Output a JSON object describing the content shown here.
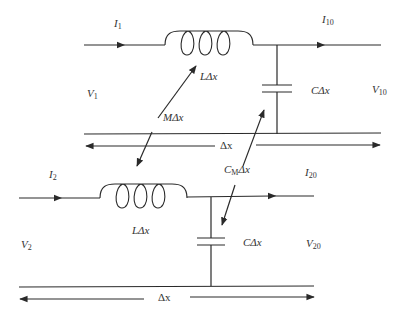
{
  "diagram": {
    "line1": {
      "current_in": {
        "sym": "I",
        "sub": "1"
      },
      "current_out": {
        "sym": "I",
        "sub": "10"
      },
      "voltage_in": {
        "sym": "V",
        "sub": "1"
      },
      "voltage_out": {
        "sym": "V",
        "sub": "10"
      },
      "inductance": "LΔx",
      "capacitance": "CΔx",
      "length": "Δx"
    },
    "line2": {
      "current_in": {
        "sym": "I",
        "sub": "2"
      },
      "current_out": {
        "sym": "I",
        "sub": "20"
      },
      "voltage_in": {
        "sym": "V",
        "sub": "2"
      },
      "voltage_out": {
        "sym": "V",
        "sub": "20"
      },
      "inductance": "LΔx",
      "capacitance": "CΔx",
      "length": "Δx"
    },
    "coupling": {
      "mutual_inductance": "MΔx",
      "mutual_capacitance": {
        "sym": "C",
        "sub": "M",
        "suffix": "Δx"
      }
    },
    "colors": {
      "line": "#2a2a2a",
      "text": "#333333",
      "background": "#ffffff"
    }
  }
}
